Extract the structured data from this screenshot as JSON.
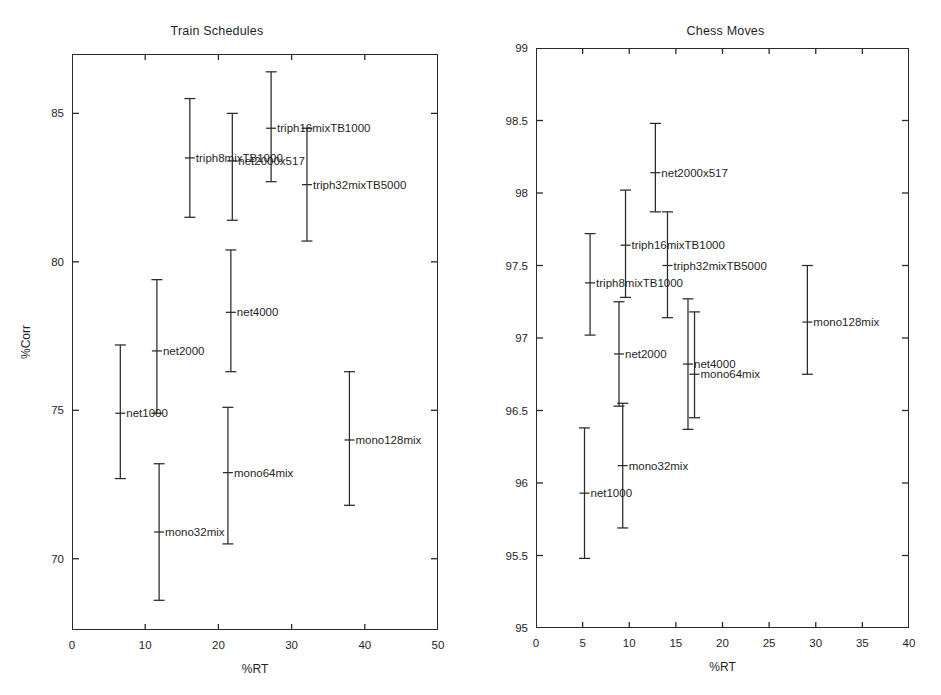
{
  "figure": {
    "background": "#ffffff",
    "ink_color": "#2a2a2a"
  },
  "chart_data": [
    {
      "type": "scatter",
      "title": "Train Schedules",
      "xlabel": "%RT",
      "ylabel": "%Corr",
      "xlim": [
        0,
        50
      ],
      "ylim": [
        67.6,
        87.0
      ],
      "xticks": [
        0,
        10,
        20,
        30,
        40,
        50
      ],
      "xtick_labels": [
        "0",
        "10",
        "20",
        "30",
        "40",
        "50"
      ],
      "yticks": [
        70,
        75,
        80,
        85
      ],
      "ytick_labels": [
        "70",
        "75",
        "80",
        "85"
      ],
      "grid": false,
      "legend": "none",
      "errorbar_style": "vertical-with-caps-and-center-tick",
      "points": [
        {
          "label": "net1000",
          "x": 6.6,
          "y": 74.9,
          "ylow": 72.7,
          "yhigh": 77.2,
          "label_side": "right"
        },
        {
          "label": "net2000",
          "x": 11.6,
          "y": 77.0,
          "ylow": 74.9,
          "yhigh": 79.4,
          "label_side": "right"
        },
        {
          "label": "net4000",
          "x": 21.7,
          "y": 78.3,
          "ylow": 76.3,
          "yhigh": 80.4,
          "label_side": "right"
        },
        {
          "label": "mono32mix",
          "x": 11.9,
          "y": 70.9,
          "ylow": 68.6,
          "yhigh": 73.2,
          "label_side": "right"
        },
        {
          "label": "mono64mix",
          "x": 21.3,
          "y": 72.9,
          "ylow": 70.5,
          "yhigh": 75.1,
          "label_side": "right"
        },
        {
          "label": "mono128mix",
          "x": 37.9,
          "y": 74.0,
          "ylow": 71.8,
          "yhigh": 76.3,
          "label_side": "right"
        },
        {
          "label": "triph8mixTB1000",
          "x": 16.1,
          "y": 83.5,
          "ylow": 81.5,
          "yhigh": 85.5,
          "label_side": "right"
        },
        {
          "label": "net2000x517",
          "x": 21.9,
          "y": 83.4,
          "ylow": 81.4,
          "yhigh": 85.0,
          "label_side": "right"
        },
        {
          "label": "triph16mixTB1000",
          "x": 27.2,
          "y": 84.5,
          "ylow": 82.7,
          "yhigh": 86.4,
          "label_side": "right"
        },
        {
          "label": "triph32mixTB5000",
          "x": 32.1,
          "y": 82.6,
          "ylow": 80.7,
          "yhigh": 84.5,
          "label_side": "right"
        }
      ]
    },
    {
      "type": "scatter",
      "title": "Chess Moves",
      "xlabel": "%RT",
      "ylabel": "",
      "xlim": [
        0,
        40
      ],
      "ylim": [
        95,
        99
      ],
      "xticks": [
        0,
        5,
        10,
        15,
        20,
        25,
        30,
        35,
        40
      ],
      "xtick_labels": [
        "0",
        "5",
        "10",
        "15",
        "20",
        "25",
        "30",
        "35",
        "40"
      ],
      "yticks": [
        95,
        95.5,
        96,
        96.5,
        97,
        97.5,
        98,
        98.5,
        99
      ],
      "ytick_labels": [
        "95",
        "95.5",
        "96",
        "96.5",
        "97",
        "97.5",
        "98",
        "98.5",
        "99"
      ],
      "grid": false,
      "legend": "none",
      "errorbar_style": "vertical-with-caps-and-center-tick",
      "points": [
        {
          "label": "net1000",
          "x": 5.2,
          "y": 95.93,
          "ylow": 95.48,
          "yhigh": 96.38,
          "label_side": "right"
        },
        {
          "label": "net2000",
          "x": 8.9,
          "y": 96.89,
          "ylow": 96.53,
          "yhigh": 97.25,
          "label_side": "right"
        },
        {
          "label": "net4000",
          "x": 16.3,
          "y": 96.82,
          "ylow": 96.37,
          "yhigh": 97.27,
          "label_side": "right"
        },
        {
          "label": "mono32mix",
          "x": 9.3,
          "y": 96.12,
          "ylow": 95.69,
          "yhigh": 96.55,
          "label_side": "right"
        },
        {
          "label": "mono64mix",
          "x": 17.0,
          "y": 96.75,
          "ylow": 96.45,
          "yhigh": 97.18,
          "label_side": "right"
        },
        {
          "label": "mono128mix",
          "x": 29.1,
          "y": 97.11,
          "ylow": 96.75,
          "yhigh": 97.5,
          "label_side": "right"
        },
        {
          "label": "triph8mixTB1000",
          "x": 5.8,
          "y": 97.38,
          "ylow": 97.02,
          "yhigh": 97.72,
          "label_side": "right"
        },
        {
          "label": "triph16mixTB1000",
          "x": 9.6,
          "y": 97.64,
          "ylow": 97.28,
          "yhigh": 98.02,
          "label_side": "right"
        },
        {
          "label": "net2000x517",
          "x": 12.8,
          "y": 98.14,
          "ylow": 97.87,
          "yhigh": 98.48,
          "label_side": "right"
        },
        {
          "label": "triph32mixTB5000",
          "x": 14.1,
          "y": 97.5,
          "ylow": 97.14,
          "yhigh": 97.87,
          "label_side": "right"
        }
      ]
    }
  ]
}
